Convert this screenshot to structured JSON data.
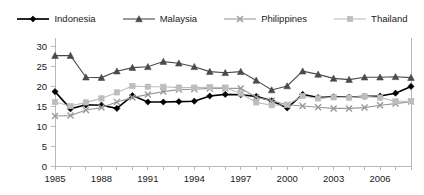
{
  "chart_data": {
    "type": "line",
    "title": "",
    "subtitle": "",
    "xlabel": "",
    "ylabel": "",
    "xlim": [
      1985,
      2008
    ],
    "ylim": [
      0,
      30
    ],
    "yticks": [
      0,
      5,
      10,
      15,
      20,
      25,
      30
    ],
    "ytick_labels": [
      "0",
      "5",
      "10",
      "15",
      "20",
      "25",
      "30"
    ],
    "x": [
      1985,
      1986,
      1987,
      1988,
      1989,
      1990,
      1991,
      1992,
      1993,
      1994,
      1995,
      1996,
      1997,
      1998,
      1999,
      2000,
      2001,
      2002,
      2003,
      2004,
      2005,
      2006,
      2007,
      2008
    ],
    "xticks": [
      1985,
      1986,
      1987,
      1988,
      1989,
      1990,
      1991,
      1992,
      1993,
      1994,
      1995,
      1996,
      1997,
      1998,
      1999,
      2000,
      2001,
      2002,
      2003,
      2004,
      2005,
      2006,
      2007,
      2008
    ],
    "xtick_labels": [
      "1985",
      "",
      "",
      "1988",
      "",
      "",
      "1991",
      "",
      "",
      "1994",
      "",
      "",
      "1997",
      "",
      "",
      "2000",
      "",
      "",
      "2003",
      "",
      "",
      "2006",
      "",
      ""
    ],
    "grid": false,
    "legend_position": "top-center",
    "series": [
      {
        "name": "Indonesia",
        "color": "#000000",
        "marker": "diamond",
        "values": [
          18.6,
          14.3,
          15.3,
          15.2,
          14.4,
          17.6,
          16.0,
          16.0,
          16.1,
          16.2,
          17.5,
          17.9,
          17.8,
          17.4,
          16.3,
          14.5,
          17.9,
          17.1,
          17.3,
          17.2,
          17.4,
          17.5,
          18.2,
          19.9
        ]
      },
      {
        "name": "Malaysia",
        "color": "#4a4a4a",
        "marker": "triangle",
        "values": [
          27.6,
          27.6,
          22.2,
          22.1,
          23.7,
          24.6,
          24.8,
          26.1,
          25.7,
          24.8,
          23.6,
          23.3,
          23.6,
          21.4,
          19.0,
          20.0,
          23.7,
          22.9,
          21.9,
          21.6,
          22.2,
          22.2,
          22.3,
          22.1
        ]
      },
      {
        "name": "Philippines",
        "color": "#9a9a9a",
        "marker": "x",
        "values": [
          12.5,
          12.6,
          14.0,
          14.6,
          16.0,
          17.1,
          17.9,
          18.6,
          19.1,
          19.2,
          19.4,
          19.4,
          19.4,
          17.2,
          16.3,
          15.3,
          15.0,
          14.7,
          14.4,
          14.4,
          14.6,
          15.2,
          15.6,
          16.1
        ]
      },
      {
        "name": "Thailand",
        "color": "#bdbdbd",
        "marker": "square",
        "values": [
          16.0,
          15.0,
          15.9,
          16.9,
          18.4,
          20.0,
          19.8,
          19.8,
          19.6,
          19.6,
          19.7,
          19.6,
          18.1,
          15.9,
          15.2,
          15.3,
          17.5,
          16.9,
          17.2,
          17.1,
          17.4,
          17.1,
          16.2,
          16.2
        ]
      }
    ]
  },
  "legend": {
    "items": [
      {
        "label": "Indonesia"
      },
      {
        "label": "Malaysia"
      },
      {
        "label": "Philippines"
      },
      {
        "label": "Thailand"
      }
    ]
  }
}
